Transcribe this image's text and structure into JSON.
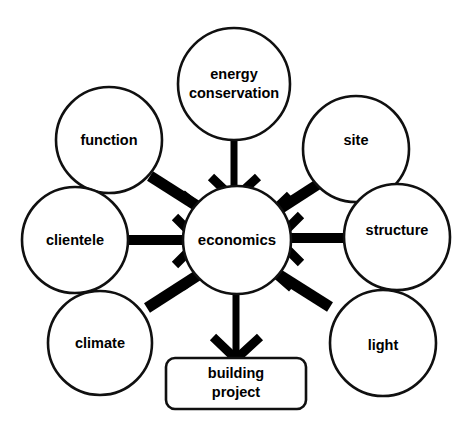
{
  "diagram": {
    "type": "radial-convergence",
    "background_color": "#ffffff",
    "stroke_color": "#101010",
    "arrow_color": "#000000",
    "center": {
      "id": "economics",
      "label": "economics",
      "shape": "circle",
      "cx": 237,
      "cy": 240,
      "r": 54
    },
    "outcome": {
      "id": "building-project",
      "label_line1": "building",
      "label_line2": "project",
      "shape": "rounded-rectangle",
      "x": 166,
      "y": 358,
      "width": 140,
      "height": 51,
      "rx": 9
    },
    "inputs": [
      {
        "id": "energy-conservation",
        "label_line1": "energy",
        "label_line2": "conservation",
        "shape": "circle",
        "cx": 234,
        "cy": 84,
        "r": 56,
        "two_line": true
      },
      {
        "id": "function",
        "label_line1": "function",
        "shape": "circle",
        "cx": 109,
        "cy": 140,
        "r": 53,
        "two_line": false
      },
      {
        "id": "clientele",
        "label_line1": "clientele",
        "shape": "circle",
        "cx": 75,
        "cy": 240,
        "r": 53,
        "two_line": false
      },
      {
        "id": "climate",
        "label_line1": "climate",
        "shape": "circle",
        "cx": 100,
        "cy": 343,
        "r": 52,
        "two_line": false
      },
      {
        "id": "site",
        "label_line1": "site",
        "shape": "circle",
        "cx": 356,
        "cy": 149,
        "r": 53,
        "two_line": false
      },
      {
        "id": "structure",
        "label_line1": "structure",
        "shape": "circle",
        "cx": 397,
        "cy": 237,
        "r": 53,
        "two_line": false
      },
      {
        "id": "light",
        "label_line1": "light",
        "shape": "circle",
        "cx": 383,
        "cy": 343,
        "r": 53,
        "two_line": false
      }
    ],
    "edges": [
      {
        "from": "energy-conservation",
        "to": "economics",
        "style": "thin-shaft-v-head"
      },
      {
        "from": "function",
        "to": "economics",
        "style": "thick-shaft-v-head"
      },
      {
        "from": "clientele",
        "to": "economics",
        "style": "thick-shaft-v-head"
      },
      {
        "from": "climate",
        "to": "economics",
        "style": "thick-shaft-v-head"
      },
      {
        "from": "site",
        "to": "economics",
        "style": "thick-shaft-v-head"
      },
      {
        "from": "structure",
        "to": "economics",
        "style": "thick-shaft-v-head"
      },
      {
        "from": "light",
        "to": "economics",
        "style": "thick-shaft-v-head"
      },
      {
        "from": "economics",
        "to": "building-project",
        "style": "thin-shaft-v-head"
      }
    ]
  }
}
